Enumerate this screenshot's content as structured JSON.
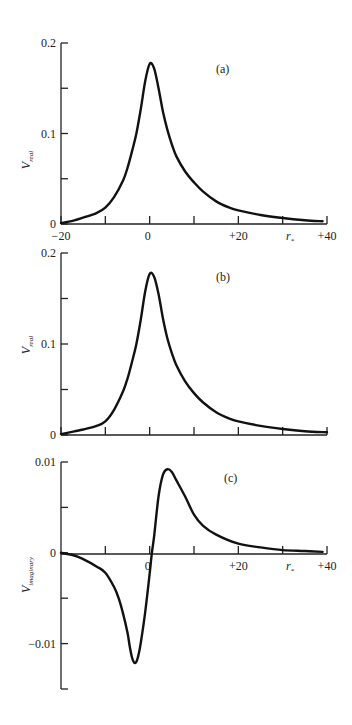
{
  "figure": {
    "panels": [
      {
        "id": "a",
        "label": "(a)"
      },
      {
        "id": "b",
        "label": "(b)"
      },
      {
        "id": "c",
        "label": "(c)"
      }
    ]
  },
  "chart_data": [
    {
      "type": "line",
      "panel": "(a)",
      "title": "",
      "xlabel": "r*",
      "ylabel": "V_real",
      "xlim": [
        -20,
        40
      ],
      "ylim": [
        0,
        0.2
      ],
      "x_ticks": [
        -20,
        -10,
        0,
        10,
        20,
        30,
        40
      ],
      "x_tick_labels": [
        "−20",
        "",
        "0",
        "",
        "+20",
        "",
        "+40"
      ],
      "y_ticks": [
        0,
        0.05,
        0.1,
        0.15,
        0.2
      ],
      "y_tick_labels": [
        "0",
        "",
        "0.1",
        "",
        "0.2"
      ],
      "grid": false,
      "legend": null,
      "series": [
        {
          "name": "V_real",
          "x": [
            -20,
            -17,
            -15,
            -12,
            -10,
            -8,
            -6,
            -5,
            -4,
            -3,
            -2,
            -1,
            0,
            1,
            2,
            3,
            4,
            5,
            6,
            8,
            10,
            12,
            15,
            18,
            20,
            25,
            30,
            35,
            39
          ],
          "y": [
            0.001,
            0.004,
            0.007,
            0.012,
            0.018,
            0.03,
            0.048,
            0.062,
            0.08,
            0.1,
            0.127,
            0.158,
            0.177,
            0.172,
            0.15,
            0.124,
            0.104,
            0.088,
            0.075,
            0.058,
            0.046,
            0.036,
            0.025,
            0.018,
            0.015,
            0.01,
            0.0066,
            0.0042,
            0.003
          ]
        }
      ]
    },
    {
      "type": "line",
      "panel": "(b)",
      "title": "",
      "xlabel": "",
      "ylabel": "V_real",
      "xlim": [
        -20,
        40
      ],
      "ylim": [
        0,
        0.2
      ],
      "x_ticks": [
        -20,
        -10,
        0,
        10,
        20,
        30,
        40
      ],
      "x_tick_labels": [],
      "y_ticks": [
        0,
        0.05,
        0.1,
        0.15,
        0.2
      ],
      "y_tick_labels": [
        "0",
        "",
        "0.1",
        "",
        "0.2"
      ],
      "grid": false,
      "legend": null,
      "series": [
        {
          "name": "V_real",
          "x": [
            -20,
            -17,
            -15,
            -12,
            -10,
            -8,
            -6,
            -5,
            -4,
            -3,
            -2,
            -1,
            0,
            1,
            2,
            3,
            4,
            5,
            6,
            8,
            10,
            12,
            15,
            18,
            20,
            25,
            30,
            35,
            40
          ],
          "y": [
            0.001,
            0.004,
            0.006,
            0.01,
            0.015,
            0.028,
            0.048,
            0.062,
            0.08,
            0.1,
            0.127,
            0.158,
            0.177,
            0.174,
            0.155,
            0.128,
            0.106,
            0.09,
            0.077,
            0.059,
            0.046,
            0.036,
            0.025,
            0.018,
            0.015,
            0.01,
            0.0066,
            0.0042,
            0.003
          ]
        }
      ]
    },
    {
      "type": "line",
      "panel": "(c)",
      "title": "",
      "xlabel": "r*",
      "ylabel": "V_imaginary",
      "xlim": [
        -20,
        40
      ],
      "ylim": [
        -0.015,
        0.01
      ],
      "x_ticks": [
        -10,
        0,
        10,
        20,
        30,
        40
      ],
      "x_tick_labels": [
        "",
        "0",
        "",
        "+20",
        "",
        "+40"
      ],
      "y_ticks": [
        0.01,
        0.005,
        0,
        -0.005,
        -0.01,
        -0.015
      ],
      "y_tick_labels": [
        "0.01",
        "",
        "0",
        "",
        "−0.01",
        ""
      ],
      "grid": false,
      "legend": null,
      "series": [
        {
          "name": "V_imaginary",
          "x": [
            -20,
            -17,
            -15,
            -12,
            -10,
            -8,
            -7,
            -6,
            -5,
            -4.5,
            -4,
            -3.5,
            -3,
            -2.5,
            -2,
            -1,
            0,
            0.5,
            1,
            2,
            3,
            4,
            5,
            6,
            8,
            10,
            12,
            15,
            20,
            25,
            30,
            35,
            39
          ],
          "y": [
            0,
            -0.0003,
            -0.0007,
            -0.0015,
            -0.0022,
            -0.0038,
            -0.005,
            -0.0067,
            -0.0088,
            -0.0103,
            -0.0115,
            -0.0121,
            -0.012,
            -0.0112,
            -0.0099,
            -0.0065,
            -0.0023,
            0,
            0.0018,
            0.0062,
            0.0086,
            0.0092,
            0.0089,
            0.008,
            0.0062,
            0.0042,
            0.003,
            0.002,
            0.001,
            0.0006,
            0.0003,
            0.0002,
            0.0001
          ]
        }
      ]
    }
  ]
}
